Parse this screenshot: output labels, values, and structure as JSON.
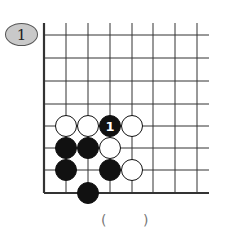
{
  "problem": {
    "number": "1"
  },
  "board": {
    "columns_x": [
      44,
      66,
      88,
      110,
      132,
      153,
      175,
      197
    ],
    "rows_y": [
      35,
      58,
      81,
      104,
      126,
      148,
      170,
      193
    ],
    "top_y": 23,
    "right_x": 209,
    "stone_radius": 10.5,
    "colors": {
      "line": "#333333",
      "black": "#111111",
      "white": "#ffffff",
      "label_on_black": "#ffffff"
    },
    "stones": [
      {
        "color": "white",
        "col": 1,
        "row": 4
      },
      {
        "color": "white",
        "col": 2,
        "row": 4
      },
      {
        "color": "black",
        "col": 3,
        "row": 4,
        "label": "1"
      },
      {
        "color": "white",
        "col": 4,
        "row": 4
      },
      {
        "color": "black",
        "col": 1,
        "row": 5
      },
      {
        "color": "black",
        "col": 2,
        "row": 5
      },
      {
        "color": "white",
        "col": 3,
        "row": 5
      },
      {
        "color": "black",
        "col": 1,
        "row": 6
      },
      {
        "color": "black",
        "col": 3,
        "row": 6
      },
      {
        "color": "white",
        "col": 4,
        "row": 6
      },
      {
        "color": "black",
        "col": 2,
        "row": 7
      }
    ]
  },
  "answer": {
    "open": "(",
    "close": ")",
    "value": ""
  }
}
